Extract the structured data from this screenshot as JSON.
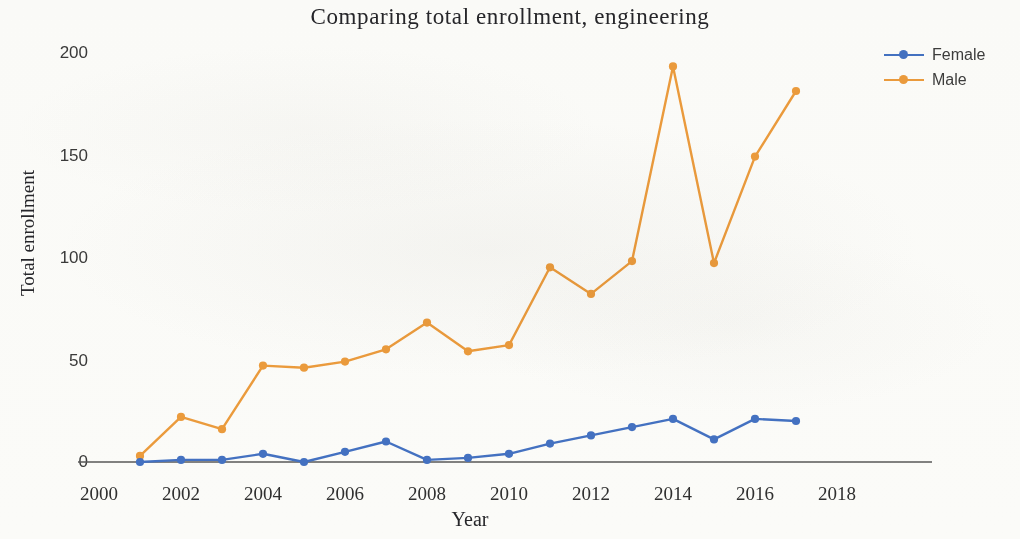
{
  "chart_data": {
    "type": "line",
    "title": "Comparing total enrollment, engineering",
    "xlabel": "Year",
    "ylabel": "Total enrollment",
    "x": [
      2001,
      2002,
      2003,
      2004,
      2005,
      2006,
      2007,
      2008,
      2009,
      2010,
      2011,
      2012,
      2013,
      2014,
      2015,
      2016,
      2017
    ],
    "xlim": [
      2000,
      2018
    ],
    "ylim": [
      0,
      200
    ],
    "xticks": [
      2000,
      2002,
      2004,
      2006,
      2008,
      2010,
      2012,
      2014,
      2016,
      2018
    ],
    "yticks": [
      0,
      50,
      100,
      150,
      200
    ],
    "grid": false,
    "legend_position": "right",
    "series": [
      {
        "name": "Female",
        "color": "#4472c4",
        "values": [
          0,
          1,
          1,
          4,
          0,
          5,
          10,
          1,
          2,
          4,
          9,
          13,
          17,
          21,
          11,
          21,
          20
        ]
      },
      {
        "name": "Male",
        "color": "#ed9c3d",
        "values": [
          3,
          22,
          16,
          47,
          46,
          49,
          55,
          68,
          54,
          57,
          95,
          82,
          98,
          193,
          97,
          149,
          181
        ]
      }
    ]
  },
  "axes": {
    "y_tick_labels": [
      "200",
      "150",
      "100",
      "50",
      "0"
    ],
    "x_tick_labels": [
      "2000",
      "2002",
      "2004",
      "2006",
      "2008",
      "2010",
      "2012",
      "2014",
      "2016",
      "2018"
    ]
  },
  "legend": {
    "items": [
      {
        "label": "Female",
        "color": "#4472c4"
      },
      {
        "label": "Male",
        "color": "#ed9c3d"
      }
    ]
  },
  "colors": {
    "female": "#4472c4",
    "male": "#ed9c3d",
    "axis": "#58585a",
    "text": "#26262a",
    "background": "#fdfdfc"
  }
}
